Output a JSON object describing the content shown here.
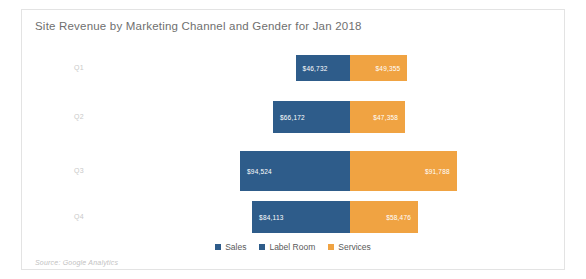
{
  "card": {
    "title": "Site Revenue by Marketing Channel and Gender for Jan 2018",
    "source_note": "Source: Google Analytics"
  },
  "legend": {
    "items": [
      {
        "label": "Sales",
        "color": "#2e5c8a"
      },
      {
        "label": "Label Room",
        "color": "#2e5c8a"
      },
      {
        "label": "Services",
        "color": "#f0a342"
      }
    ]
  },
  "chart_data": {
    "type": "bar",
    "orientation": "horizontal",
    "stacked": true,
    "diverging": true,
    "title": "Site Revenue by Marketing Channel and Gender for Jan 2018",
    "xlabel": "",
    "ylabel": "",
    "grid": false,
    "legend_position": "bottom-center",
    "categories": [
      "Q1",
      "Q2",
      "Q3",
      "Q4"
    ],
    "series": [
      {
        "name": "Sales",
        "color": "#2e5c8a",
        "direction": "left",
        "values": [
          46732,
          66172,
          94524,
          84113
        ],
        "labels": [
          "$46,732",
          "$66,172",
          "$94,524",
          "$84,113"
        ]
      },
      {
        "name": "Services",
        "color": "#f0a342",
        "direction": "right",
        "values": [
          49355,
          47358,
          91788,
          58476
        ],
        "labels": [
          "$49,355",
          "$47,358",
          "$91,788",
          "$58,476"
        ]
      }
    ]
  }
}
